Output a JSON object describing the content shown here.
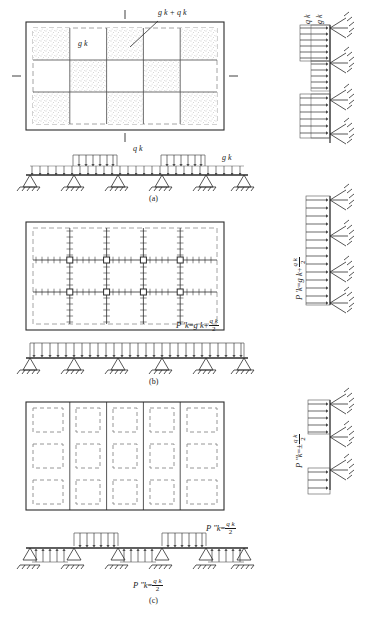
{
  "figure": {
    "panels": [
      {
        "id": "a",
        "caption": "(a)",
        "plan_label_dead": "g k",
        "plan_label_total": "g k + q k",
        "beam_label_live": "q k",
        "beam_label_dead": "g k",
        "column_label_live": "q k",
        "column_label_dead": "g k",
        "description": "Checkerboard live-load pattern on floor plan; continuous beam with alternate spans loaded; column with partial distributed loads",
        "grid": {
          "cols": 5,
          "rows": 3,
          "shaded_pattern": "checkerboard"
        },
        "beam": {
          "supports": 6,
          "spans": 5,
          "loaded_spans": [
            2,
            4
          ]
        }
      },
      {
        "id": "b",
        "caption": "(b)",
        "formula_lhs": "P ′k",
        "formula_eq": "=",
        "formula_rhs_first": "g k",
        "formula_plus": "+",
        "formula_frac_num": "q k",
        "formula_frac_den": "2",
        "description": "Symmetric full load P'k = gk + qk/2 on all spans; grid of beams with tick-hatched members and column nodes",
        "grid": {
          "cols": 5,
          "rows": 3,
          "nodes": 8
        },
        "beam": {
          "supports": 6,
          "spans": 5,
          "loaded_spans": [
            1,
            2,
            3,
            4,
            5
          ]
        }
      },
      {
        "id": "c",
        "caption": "(c)",
        "formula_lhs": "P ″k",
        "formula_eq": "=",
        "formula_frac_num": "q k",
        "formula_frac_den": "2",
        "formula_pm": "±",
        "description": "Anti-symmetric alternating load P″k = ± qk/2; dashed panel grid; beam with alternating up/down span loads",
        "grid": {
          "cols": 5,
          "rows": 3,
          "style": "dashed"
        },
        "beam": {
          "supports": 6,
          "spans": 5,
          "down_loaded_spans": [
            2,
            4
          ],
          "up_loaded_spans": [
            1,
            3,
            5
          ]
        }
      }
    ],
    "colors": {
      "ink": "#1a1a1a",
      "solid_line": "#2b2b2b",
      "dashed_line": "#8a8a8a",
      "stipple": "#9a9a9a",
      "background": "#ffffff"
    }
  }
}
